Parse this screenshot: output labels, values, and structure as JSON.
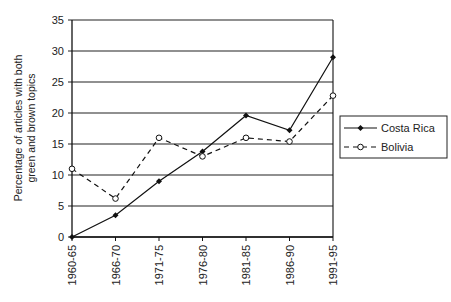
{
  "chart_data": {
    "type": "line",
    "title": "",
    "xlabel": "",
    "ylabel": "Percentage of articles with both green and brown topics",
    "ylabel_lines": [
      "Percentage of articles with both",
      "green and brown topics"
    ],
    "categories": [
      "1960-65",
      "1966-70",
      "1971-75",
      "1976-80",
      "1981-85",
      "1986-90",
      "1991-95"
    ],
    "series": [
      {
        "name": "Costa Rica",
        "marker": "filled-diamond",
        "line": "solid",
        "values": [
          0,
          3.5,
          9,
          13.8,
          19.6,
          17.2,
          29
        ]
      },
      {
        "name": "Bolivia",
        "marker": "open-circle",
        "line": "dashed",
        "values": [
          11,
          6.2,
          16,
          13,
          16,
          15.4,
          22.8
        ]
      }
    ],
    "ylim": [
      0,
      35
    ],
    "yticks": [
      0,
      5,
      10,
      15,
      20,
      25,
      30,
      35
    ],
    "grid": {
      "horizontal": true,
      "vertical": false
    },
    "legend_position": "right"
  },
  "legend": {
    "items": [
      {
        "label": "Costa Rica"
      },
      {
        "label": "Bolivia"
      }
    ]
  },
  "colors": {
    "line": "#111111",
    "grid": "#222222",
    "text": "#222222",
    "background": "#ffffff"
  }
}
